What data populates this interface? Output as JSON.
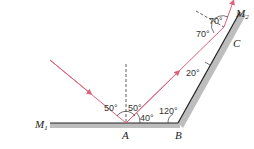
{
  "diagram": {
    "colors": {
      "ray": "#e0607a",
      "mirror_line": "#222222",
      "mirror_fill": "#bdbdbd",
      "normal": "#333333",
      "caption_tag": "#2a8fd6"
    },
    "mirrors": [
      {
        "name": "M1",
        "label": "M",
        "subscript": "1"
      },
      {
        "name": "M2",
        "label": "M",
        "subscript": "2"
      }
    ],
    "points": {
      "A": "A",
      "B": "B",
      "C": "C"
    },
    "angles": {
      "incident_at_A": "50°",
      "reflected_at_A": "50°",
      "ray_to_mirror_at_A": "40°",
      "mirror_angle_at_B": "120°",
      "ray_to_mirror_at_C": "20°",
      "incident_at_C": "70°",
      "reflected_at_C": "70°"
    },
    "caption": {
      "visible": "partially cut off"
    }
  }
}
